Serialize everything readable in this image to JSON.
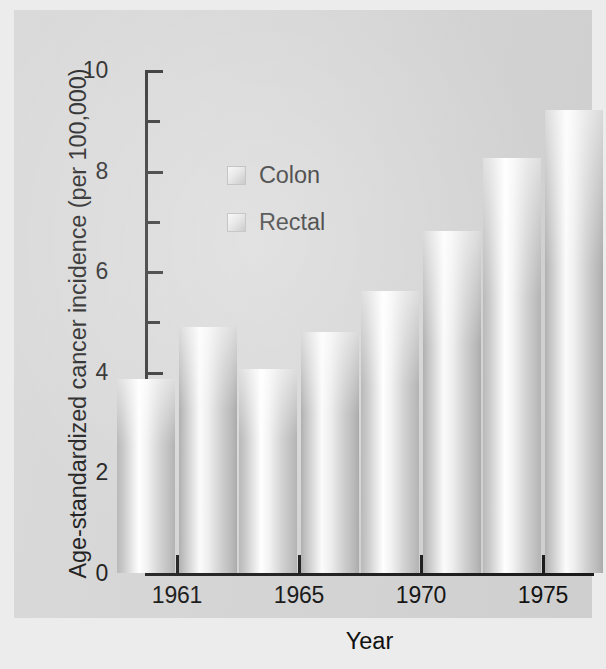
{
  "chart_data": {
    "type": "bar",
    "title": "",
    "xlabel": "Year",
    "ylabel": "Age-standardized cancer incidence (per 100,000)",
    "categories": [
      "1961",
      "1965",
      "1970",
      "1975"
    ],
    "series": [
      {
        "name": "Colon",
        "values": [
          3.85,
          4.05,
          5.6,
          8.25
        ]
      },
      {
        "name": "Rectal",
        "values": [
          4.9,
          4.8,
          6.8,
          9.2
        ]
      }
    ],
    "ylim": [
      0,
      10
    ],
    "y_major_ticks": [
      "0",
      "2",
      "4",
      "6",
      "8",
      "10"
    ],
    "y_major_values": [
      0,
      2,
      4,
      6,
      8,
      10
    ],
    "y_minor_values": [
      1,
      3,
      5,
      7,
      9
    ],
    "grid": false,
    "legend_position": "upper-center-left"
  },
  "axes": {
    "y_title": "Age-standardized cancer incidence (per 100,000)",
    "x_title": "Year",
    "y_labels": [
      "10",
      "8",
      "6",
      "4",
      "2",
      "0"
    ],
    "x_labels": [
      "1961",
      "1965",
      "1970",
      "1975"
    ]
  },
  "legend": {
    "items": [
      {
        "label": "Colon"
      },
      {
        "label": "Rectal"
      }
    ]
  },
  "colors": {
    "background": "#d6d6d6",
    "page": "#ececec",
    "axis": "#1b1b1b",
    "text": "#111111",
    "bar_light": "#ffffff",
    "bar_dark": "#b0b0b0"
  }
}
